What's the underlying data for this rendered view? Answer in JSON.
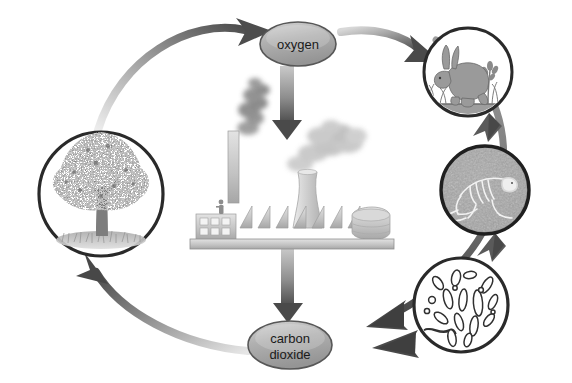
{
  "diagram": {
    "background_color": "#ffffff",
    "nodes": {
      "oxygen": {
        "label": "oxygen",
        "shape": "ellipse",
        "fill": "#b4b4b4",
        "stroke": "#4a4a4a",
        "cx": 298,
        "cy": 44,
        "rx": 38,
        "ry": 22
      },
      "carbon_dioxide": {
        "label_line1": "carbon",
        "label_line2": "dioxide",
        "shape": "ellipse",
        "fill": "#b4b4b4",
        "stroke": "#4a4a4a",
        "cx": 290,
        "cy": 345,
        "rx": 42,
        "ry": 24
      },
      "tree": {
        "name": "tree",
        "shape": "circle",
        "fill": "#ffffff",
        "stroke": "#2a2a2a",
        "cx": 101,
        "cy": 194,
        "r": 62
      },
      "rabbit": {
        "name": "rabbit",
        "shape": "circle",
        "fill": "#ffffff",
        "stroke": "#2a2a2a",
        "cx": 468,
        "cy": 72,
        "r": 44
      },
      "carcass": {
        "name": "animal-skeleton-in-soil",
        "shape": "circle",
        "fill": "#a8a8a8",
        "stroke": "#1f1f1f",
        "cx": 485,
        "cy": 190,
        "r": 44
      },
      "bacteria": {
        "name": "bacteria",
        "shape": "circle",
        "fill": "#ffffff",
        "stroke": "#2a2a2a",
        "cx": 461,
        "cy": 305,
        "r": 47
      },
      "factory": {
        "name": "factory",
        "cx": 283,
        "cy": 200
      }
    },
    "arrows": [
      {
        "name": "arrow-tree-to-oxygen",
        "from": "tree",
        "to": "oxygen",
        "style": "curved-gradient"
      },
      {
        "name": "arrow-oxygen-to-rabbit",
        "from": "oxygen",
        "to": "rabbit",
        "style": "curved-gradient"
      },
      {
        "name": "arrow-oxygen-to-factory",
        "from": "oxygen",
        "to": "factory",
        "style": "straight-gradient"
      },
      {
        "name": "arrow-rabbit-to-carcass",
        "from": "rabbit",
        "to": "carcass",
        "style": "short-solid"
      },
      {
        "name": "arrow-carcass-to-bacteria",
        "from": "carcass",
        "to": "bacteria",
        "style": "short-solid"
      },
      {
        "name": "arrow-bacteria-to-carbon-dioxide",
        "from": "bacteria",
        "to": "carbon_dioxide",
        "style": "short-solid"
      },
      {
        "name": "arrow-factory-to-carbon-dioxide",
        "from": "factory",
        "to": "carbon_dioxide",
        "style": "straight-gradient"
      },
      {
        "name": "arrow-outer-right-to-carbon-dioxide",
        "from": "rabbit",
        "to": "carbon_dioxide",
        "style": "curved-outer"
      },
      {
        "name": "arrow-carbon-dioxide-to-tree",
        "from": "carbon_dioxide",
        "to": "tree",
        "style": "curved-gradient"
      }
    ],
    "factory_parts": {
      "chimney": "smokestack",
      "cooling_tower": "cooling-tower",
      "roof": "sawtooth-roof",
      "windows": "window-grid",
      "tank": "storage-tank",
      "worker": "worker-figure",
      "smoke_dark": "#7d7d7d",
      "smoke_light": "#b9b9b9",
      "body_fill": "#c9c9c9"
    },
    "colors": {
      "arrow_dark": "#4b4b4b",
      "arrow_mid": "#8d8d8d",
      "arrow_light": "#e2e2e2",
      "outline": "#2a2a2a",
      "soil": "#a8a8a8",
      "foliage": "#8f8f8f",
      "text": "#1a1a1a"
    }
  }
}
